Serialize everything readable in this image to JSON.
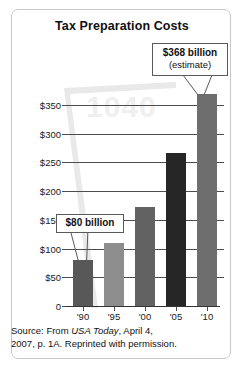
{
  "chart_data": {
    "type": "bar",
    "title": "Tax Preparation Costs",
    "xlabel": "",
    "ylabel": "",
    "categories": [
      "'90",
      "'95",
      "'00",
      "'05",
      "'10"
    ],
    "values": [
      80,
      110,
      172,
      265,
      368
    ],
    "value_units": "billions of dollars",
    "ylim": [
      0,
      380
    ],
    "yticks": [
      0,
      50,
      100,
      150,
      200,
      250,
      300,
      350
    ],
    "ytick_labels": [
      "0",
      "$50",
      "$100",
      "$150",
      "$200",
      "$250",
      "$300",
      "$350"
    ],
    "grid": true,
    "legend": null,
    "bar_colors": [
      "#585858",
      "#8d8d8d",
      "#626262",
      "#262626",
      "#6e6e6e"
    ],
    "annotations": [
      {
        "name": "callout-368",
        "line1": "$368 billion",
        "line2": "(estimate)",
        "points_to_category": "'10",
        "points_to_value": 368
      },
      {
        "name": "callout-80",
        "line1": "$80 billion",
        "line2": "",
        "points_to_category": "'90",
        "points_to_value": 80
      }
    ],
    "watermark": "1040"
  },
  "figure": {
    "title": "Tax Preparation Costs",
    "watermark": "1040"
  },
  "callout_368": {
    "amount": "$368 billion",
    "qualifier": "(estimate)"
  },
  "callout_80": {
    "amount": "$80 billion"
  },
  "source": {
    "line1_prefix": "Source: From ",
    "line1_em": "USA Today",
    "line1_suffix": ", April 4,",
    "line2": "2007, p. 1A. Reprinted with permission."
  },
  "colors": {
    "panel_border": "#c9c9c9",
    "gridline": "#4d4d4d",
    "text": "#111111",
    "watermark": "#efefef"
  }
}
